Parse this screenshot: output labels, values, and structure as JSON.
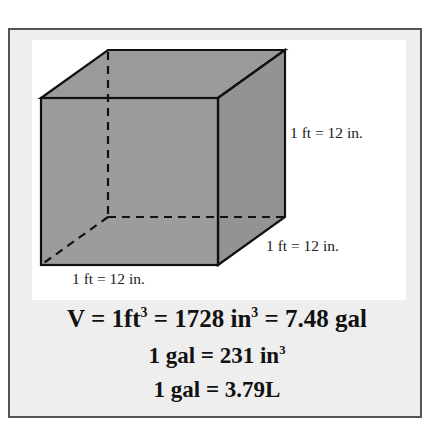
{
  "diagram": {
    "shape": "cube",
    "colors": {
      "face": "#9a9a9a",
      "edge": "#111111",
      "frame_border": "#555555",
      "frame_bg": "#eeeeee"
    },
    "labels": {
      "height": "1 ft = 12 in.",
      "depth": "1 ft = 12 in.",
      "width": "1 ft = 12 in."
    }
  },
  "equations": {
    "line1": {
      "a": "V = 1ft",
      "a_sup": "3",
      "b": " = 1728 in",
      "b_sup": "3",
      "c": " = 7.48 gal"
    },
    "line2": {
      "a": "1 gal = 231 in",
      "a_sup": "3"
    },
    "line3": {
      "a": "1 gal = 3.79L"
    }
  }
}
